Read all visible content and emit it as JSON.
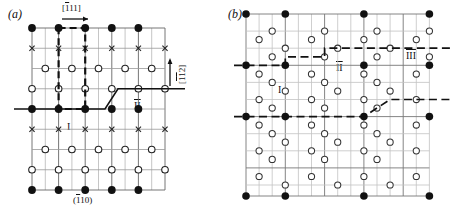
{
  "figure": {
    "type": "crystallographic-lattice-diagram",
    "panels": [
      {
        "id": "a",
        "label": "(a)",
        "direction_arrow_top": "[111]",
        "direction_arrow_top_overbar_index": 0,
        "direction_arrow_right": "[112]",
        "direction_arrow_right_overbar_indices": [
          0,
          1
        ],
        "plane_label_bottom": "(110)",
        "plane_label_overbar_index": 0,
        "region_labels": [
          "I",
          "II"
        ],
        "symbols": [
          "filled-circle",
          "open-circle",
          "cross"
        ],
        "boundary_style": "solid-stepped-line",
        "unit_cell_style": "dashed-rectangle"
      },
      {
        "id": "b",
        "label": "(b)",
        "region_labels": [
          "I",
          "II",
          "III"
        ],
        "symbols": [
          "filled-circle",
          "open-circle"
        ],
        "boundary_style": "dashed-stepped-line"
      }
    ]
  },
  "colors": {
    "ink": "#111111",
    "grid_dark": "#555555",
    "grid_light": "#b9b9b9",
    "background": "#ffffff"
  }
}
